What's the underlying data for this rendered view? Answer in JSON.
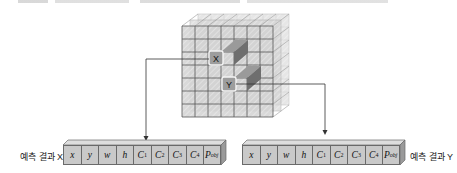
{
  "figure": {
    "type": "grid-prediction-diagram",
    "grid": {
      "rows": 7,
      "cols": 7,
      "depth_layers": 3
    },
    "highlight_cells": [
      {
        "label": "X",
        "row": 3,
        "col": 3
      },
      {
        "label": "Y",
        "row": 5,
        "col": 4
      }
    ]
  },
  "outputs": {
    "x": {
      "label": "예측 결과 X",
      "cells": [
        "x",
        "y",
        "w",
        "h",
        "C1",
        "C2",
        "C3",
        "C4",
        "Pobj"
      ]
    },
    "y": {
      "label": "예측 결과 Y",
      "cells": [
        "x",
        "y",
        "w",
        "h",
        "C1",
        "C2",
        "C3",
        "C4",
        "Pobj"
      ]
    }
  },
  "cells_display": [
    {
      "main": "x",
      "sub": ""
    },
    {
      "main": "y",
      "sub": ""
    },
    {
      "main": "w",
      "sub": ""
    },
    {
      "main": "h",
      "sub": ""
    },
    {
      "main": "C",
      "sub": "1"
    },
    {
      "main": "C",
      "sub": "2"
    },
    {
      "main": "C",
      "sub": "3"
    },
    {
      "main": "C",
      "sub": "4"
    },
    {
      "main": "P",
      "sub": "obj"
    }
  ],
  "colors": {
    "face": "#c9c9c9",
    "grid_line": "#555555",
    "highlight": "#8a8a8a",
    "arrow": "#333333"
  }
}
